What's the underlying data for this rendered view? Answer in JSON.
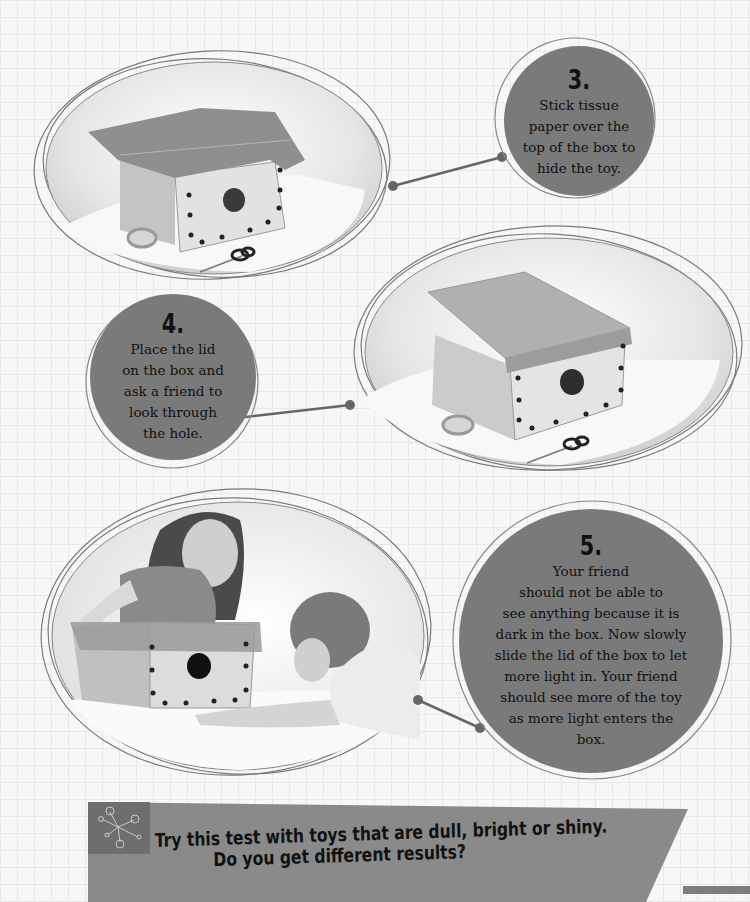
{
  "page": {
    "background": "graph-paper-grid",
    "colors": {
      "circle_fill": "#7a7a7a",
      "banner_fill": "#8a8a8a",
      "connector": "#666666",
      "text": "#111111"
    }
  },
  "steps": [
    {
      "number": "3.",
      "text_lines": [
        "Stick tissue",
        "paper over the",
        "top of the box to",
        "hide the toy."
      ],
      "photo": "box-with-tissue-paper-tape-scissors"
    },
    {
      "number": "4.",
      "text_lines": [
        "Place the lid",
        "on the box and",
        "ask a friend to",
        "look through",
        "the hole."
      ],
      "photo": "box-with-lid-tape-scissors"
    },
    {
      "number": "5.",
      "text_lines": [
        "Your friend",
        "should not be able to",
        "see anything because it is",
        "dark in the box. Now slowly",
        "slide the lid of the box to let",
        "more light in. Your friend",
        "should see more of the toy",
        "as more light enters the",
        "box."
      ],
      "photo": "two-children-looking-into-box"
    }
  ],
  "banner": {
    "icon": "molecule-network-icon",
    "line1": "Try this test with toys that are dull, bright or shiny.",
    "line2": "Do you get different results?"
  }
}
